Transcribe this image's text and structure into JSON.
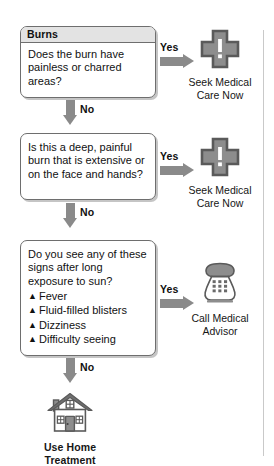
{
  "diagram": {
    "title": "Burns",
    "nodes": [
      {
        "id": "q1",
        "header": "Burns",
        "question": "Does the burn have painless or charred areas?",
        "yes_label": "Yes",
        "no_label": "No",
        "yes_target": "seek-medical-care-now-1",
        "no_target": "q2"
      },
      {
        "id": "q2",
        "header": "",
        "question": "Is this a deep, painful burn that is extensive or on the face and hands?",
        "yes_label": "Yes",
        "no_label": "No",
        "yes_target": "seek-medical-care-now-2",
        "no_target": "q3"
      },
      {
        "id": "q3",
        "header": "",
        "question": "Do you see any of these signs after long exposure to sun?",
        "bullet": "▲",
        "items": [
          "Fever",
          "Fluid-filled blisters",
          "Dizziness",
          "Difficulty seeing"
        ],
        "yes_label": "Yes",
        "no_label": "No",
        "yes_target": "call-medical-advisor",
        "no_target": "use-home-treatment"
      }
    ],
    "outcomes": [
      {
        "id": "seek-medical-care-now-1",
        "icon": "medical-cross-alert-icon",
        "caption_line1": "Seek Medical",
        "caption_line2": "Care Now"
      },
      {
        "id": "seek-medical-care-now-2",
        "icon": "medical-cross-alert-icon",
        "caption_line1": "Seek Medical",
        "caption_line2": "Care Now"
      },
      {
        "id": "call-medical-advisor",
        "icon": "telephone-icon",
        "caption_line1": "Call Medical",
        "caption_line2": "Advisor"
      },
      {
        "id": "use-home-treatment",
        "icon": "house-icon",
        "caption_line1": "Use Home",
        "caption_line2": "Treatment"
      }
    ],
    "colors": {
      "arrow": "#8a8a8a",
      "icon_fill": "#8d8d8d",
      "icon_outline": "#5f5f5f",
      "box_border": "#6e6e6e",
      "header_band": "#e3e3e3",
      "text": "#111111"
    }
  }
}
